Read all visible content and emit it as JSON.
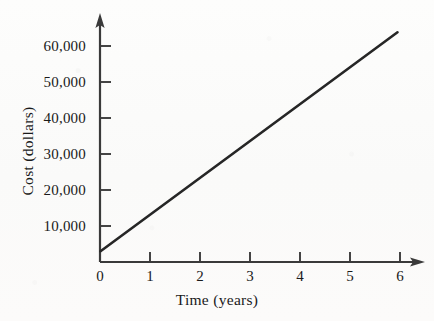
{
  "chart_data": {
    "type": "line",
    "title": "",
    "subtitle": "",
    "xlabel": "Time (years)",
    "ylabel": "Cost (dollars)",
    "xlim": [
      0,
      6.4
    ],
    "ylim": [
      0,
      67000
    ],
    "xticks": [
      0,
      1,
      2,
      3,
      4,
      5,
      6
    ],
    "xtick_labels": [
      "0",
      "1",
      "2",
      "3",
      "4",
      "5",
      "6"
    ],
    "yticks": [
      10000,
      20000,
      30000,
      40000,
      50000,
      60000
    ],
    "ytick_labels": [
      "10,000",
      "20,000",
      "30,000",
      "40,000",
      "50,000",
      "60,000"
    ],
    "grid": false,
    "legend": false,
    "legend_position": "none",
    "axis_style": "arrow-ended-L-axes",
    "series": [
      {
        "name": "Cost over time",
        "color": "#262626",
        "line_width": 2.6,
        "x": [
          0,
          1,
          2,
          3,
          4,
          5,
          5.95
        ],
        "values": [
          3000,
          13200,
          23500,
          33700,
          43900,
          54100,
          63800
        ],
        "intercept": 3000,
        "slope_per_year": 10250,
        "endpoints": {
          "start": [
            0,
            3000
          ],
          "end": [
            5.95,
            63800
          ]
        }
      }
    ]
  },
  "figure": {
    "background_color": "#fcfcfb",
    "ink_color": "#262626",
    "axis_color": "#3a3a3a"
  }
}
